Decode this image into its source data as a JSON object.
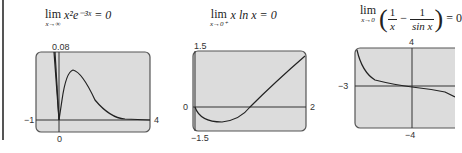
{
  "figures": [
    {
      "formula": {
        "lim": "lim",
        "sub": "x→∞",
        "expr": "x²e⁻³ˣ = 0"
      },
      "window": {
        "ymax": "0.08",
        "xmin": "−1",
        "xmax": "4",
        "ymin": "0"
      }
    },
    {
      "formula": {
        "lim": "lim",
        "sub": "x→0⁺",
        "expr": "x ln x = 0"
      },
      "window": {
        "ymax": "1.5",
        "xmin": "0",
        "xmax": "2",
        "ymin": "−1.5"
      }
    },
    {
      "formula": {
        "lim": "lim",
        "sub": "x→0",
        "num1": "1",
        "den1": "x",
        "minus": "−",
        "num2": "1",
        "den2": "sin x",
        "eq": "= 0"
      },
      "window": {
        "ymax": "4",
        "xmin": "−3",
        "ymin": "−4"
      }
    }
  ],
  "colors": {
    "screen": "#dcdcdc",
    "border": "#555555",
    "curve": "#222222"
  }
}
